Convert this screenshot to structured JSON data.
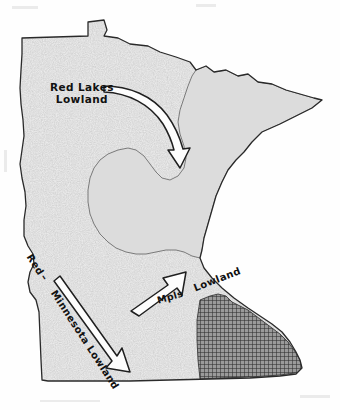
{
  "figure": {
    "kind": "physiographic-map",
    "subject": "Minnesota",
    "background_color": "#fefefe",
    "ink_color": "#1a1a1a"
  },
  "labels": {
    "red_lakes_lowland_line1": "Red Lakes",
    "red_lakes_lowland_line2": "Lowland",
    "red_word": "Red",
    "dash_word": "–",
    "minnesota_lowland": "Minnesota Lowland",
    "mpls": "Mpls",
    "lowland_se": "Lowland"
  },
  "regions": [
    {
      "name": "Red Lakes Lowland",
      "texture": "stipple",
      "fill_color": "#e8e8e8",
      "position": "northwest"
    },
    {
      "name": "Red - Minnesota Lowland",
      "texture": "stipple",
      "fill_color": "#e8e8e8",
      "position": "west-southwest"
    },
    {
      "name": "Upland",
      "texture": "solid-gray",
      "fill_color": "#dcdcdc",
      "position": "central-northeast"
    },
    {
      "name": "Mpls Lowland",
      "texture": "crosshatch",
      "fill_color": "#7a7a7a",
      "position": "southeast"
    }
  ],
  "arrows": [
    {
      "name": "red-lakes-lowland-arrow",
      "style": "outlined-curved",
      "direction": "east-southeast"
    },
    {
      "name": "mpls-lowland-arrow",
      "style": "outlined-straight",
      "direction": "northeast"
    },
    {
      "name": "minnesota-lowland-arrow",
      "style": "outlined-straight",
      "direction": "southeast"
    }
  ],
  "colors": {
    "stipple_base": "#e9e9e9",
    "upland_gray": "#dcdcdc",
    "crosshatch_dark": "#6f6f6f",
    "outline": "#2a2a2a",
    "paper": "#fefefe"
  }
}
